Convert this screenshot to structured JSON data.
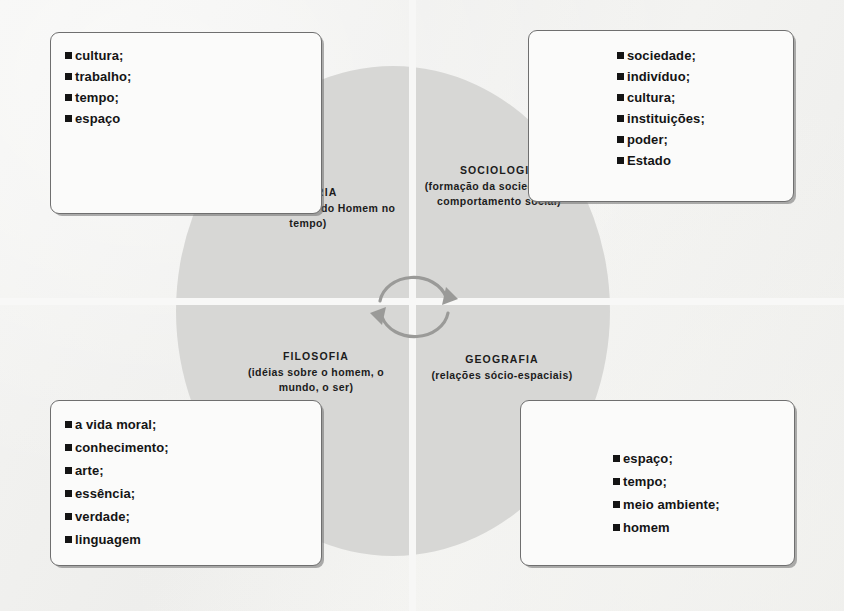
{
  "diagram": {
    "type": "quadrant-circle",
    "center_icon": "cycle-arrows-icon",
    "quadrants": [
      {
        "id": "historia",
        "position": "top-left",
        "title": "HISTÓRIA",
        "subtitle": "(Desenvolvimento do Homem no tempo)"
      },
      {
        "id": "sociologia",
        "position": "top-right",
        "title": "SOCIOLOGIA",
        "subtitle": "(formação da sociedade e o comportamento social)"
      },
      {
        "id": "filosofia",
        "position": "bottom-left",
        "title": "FILOSOFIA",
        "subtitle": "(idéias sobre o homem, o mundo, o ser)"
      },
      {
        "id": "geografia",
        "position": "bottom-right",
        "title": "GEOGRAFIA",
        "subtitle": "(relações sócio-espaciais)"
      }
    ],
    "boxes": [
      {
        "id": "historia-topics",
        "position": "top-left",
        "items": [
          "cultura;",
          "trabalho;",
          "tempo;",
          "espaço"
        ]
      },
      {
        "id": "sociologia-topics",
        "position": "top-right",
        "items": [
          "sociedade;",
          "indivíduo;",
          "cultura;",
          "instituições;",
          "poder;",
          "Estado"
        ]
      },
      {
        "id": "filosofia-topics",
        "position": "bottom-left",
        "items": [
          "a vida moral;",
          "conhecimento;",
          "arte;",
          "essência;",
          "verdade;",
          "linguagem"
        ]
      },
      {
        "id": "geografia-topics",
        "position": "bottom-right",
        "items": [
          "espaço;",
          "tempo;",
          "meio ambiente;",
          "homem"
        ]
      }
    ],
    "colors": {
      "circle_fill": "#d7d7d5",
      "divider": "#f7f7f6",
      "page_background": "#f2f2f0",
      "box_fill": "#fbfbfa",
      "box_border": "#6f6f6f",
      "text": "#141414"
    }
  }
}
